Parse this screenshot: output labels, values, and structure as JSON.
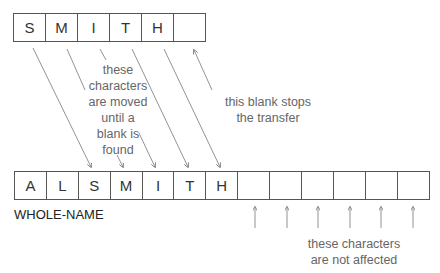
{
  "source_field": {
    "cells": [
      "S",
      "M",
      "I",
      "T",
      "H",
      ""
    ]
  },
  "target_field": {
    "label": "WHOLE-NAME",
    "cells": [
      "A",
      "L",
      "S",
      "M",
      "I",
      "T",
      "H",
      "",
      "",
      "",
      "",
      "",
      ""
    ]
  },
  "annotations": {
    "moved": "these characters are moved until a blank is found",
    "moved_lines": [
      "these",
      "characters",
      "are moved",
      "until a",
      "blank is",
      "found"
    ],
    "stop": "this blank stops the transfer",
    "stop_lines": [
      "this blank stops",
      "the transfer"
    ],
    "unaffected": "these characters are not affected",
    "unaffected_lines": [
      "these characters",
      "are not affected"
    ]
  },
  "colors": {
    "box_stroke": "#555555",
    "annotation_text": "#666666",
    "arrow": "#777777"
  }
}
